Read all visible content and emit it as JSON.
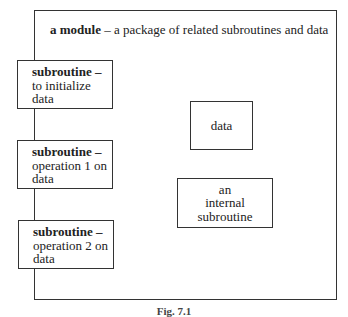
{
  "module": {
    "title_bold": "a module",
    "title_rest": " – a package of related subroutines and data"
  },
  "subroutines": [
    {
      "bold": "subroutine –",
      "line2": "to initialize",
      "line3": "data"
    },
    {
      "bold": "subroutine –",
      "line2": "operation 1 on",
      "line3": "data"
    },
    {
      "bold": "subroutine –",
      "line2": "operation 2 on",
      "line3": "data"
    }
  ],
  "data_box": {
    "label": "data"
  },
  "internal_box": {
    "line1": "an",
    "line2": "internal",
    "line3": "subroutine"
  },
  "caption": "Fig. 7.1"
}
